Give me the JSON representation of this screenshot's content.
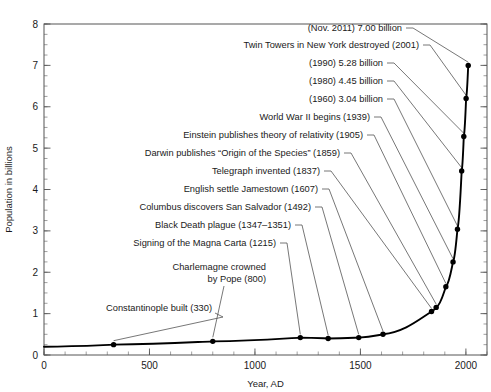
{
  "chart_data": {
    "type": "line",
    "title": "",
    "xlabel": "Year, AD",
    "ylabel": "Population in billions",
    "xlim": [
      0,
      2100
    ],
    "ylim": [
      0,
      8
    ],
    "xticks": [
      0,
      500,
      1000,
      1500,
      2000
    ],
    "xtick_labels": [
      "0",
      "500",
      "1000",
      "1500",
      "2000"
    ],
    "yticks": [
      0,
      1,
      2,
      3,
      4,
      5,
      6,
      7,
      8
    ],
    "ytick_labels": [
      "0",
      "1",
      "2",
      "3",
      "4",
      "5",
      "6",
      "7",
      "8"
    ],
    "x_minor_step": 100,
    "y_minor_step": 0.25,
    "grid": false,
    "legend": false,
    "series": [
      {
        "name": "World population",
        "x": [
          0,
          330,
          800,
          1215,
          1347,
          1492,
          1607,
          1837,
          1859,
          1905,
          1939,
          1960,
          1980,
          1990,
          2001,
          2011
        ],
        "values": [
          0.2,
          0.25,
          0.33,
          0.42,
          0.4,
          0.42,
          0.5,
          1.05,
          1.15,
          1.65,
          2.25,
          3.04,
          4.45,
          5.28,
          6.2,
          7.0
        ]
      }
    ],
    "annotations": [
      {
        "label": "Constantinople built (330)",
        "year": 330,
        "value": 0.25
      },
      {
        "label": "Charlemagne crowned",
        "label2": "by Pope (800)",
        "year": 800,
        "value": 0.33
      },
      {
        "label": "Signing of the Magna Carta (1215)",
        "year": 1215,
        "value": 0.42
      },
      {
        "label": "Black Death plague (1347–1351)",
        "year": 1347,
        "value": 0.4
      },
      {
        "label": "Columbus discovers San Salvador (1492)",
        "year": 1492,
        "value": 0.42
      },
      {
        "label": "English settle Jamestown (1607)",
        "year": 1607,
        "value": 0.5
      },
      {
        "label": "Telegraph invented (1837)",
        "year": 1837,
        "value": 1.05
      },
      {
        "label": "Darwin publishes “Origin of the Species” (1859)",
        "year": 1859,
        "value": 1.15
      },
      {
        "label": "Einstein publishes theory of relativity (1905)",
        "year": 1905,
        "value": 1.65
      },
      {
        "label": "World War II begins (1939)",
        "year": 1939,
        "value": 2.25
      },
      {
        "label": "(1960) 3.04 billion",
        "year": 1960,
        "value": 3.04
      },
      {
        "label": "(1980) 4.45 billion",
        "year": 1980,
        "value": 4.45
      },
      {
        "label": "(1990) 5.28 billion",
        "year": 1990,
        "value": 5.28
      },
      {
        "label": "Twin Towers in New York destroyed (2001)",
        "year": 2001,
        "value": 6.2
      },
      {
        "label": "(Nov. 2011) 7.00 billion",
        "year": 2011,
        "value": 7.0
      }
    ]
  },
  "colors": {
    "curve": "#000000",
    "frame": "#555555",
    "leader": "#4a4a4a",
    "text": "#1a1a1a",
    "background": "#ffffff"
  }
}
